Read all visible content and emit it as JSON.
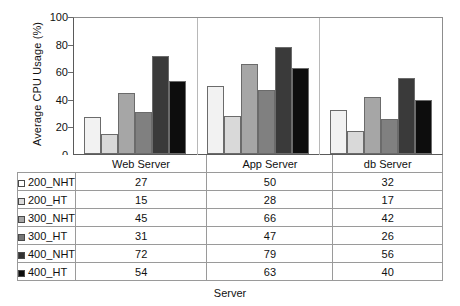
{
  "chart_data": {
    "type": "bar",
    "title": "",
    "xlabel": "Server",
    "ylabel": "Average CPU Usage (%)",
    "ylim": [
      0,
      100
    ],
    "yticks": [
      0,
      20,
      40,
      60,
      80,
      100
    ],
    "grid": false,
    "legend_position": "table-left-column",
    "categories": [
      "Web Server",
      "App Server",
      "db Server"
    ],
    "series": [
      {
        "name": "200_NHT",
        "color": "#f2f2f2",
        "values": [
          27,
          50,
          32
        ]
      },
      {
        "name": "200_HT",
        "color": "#d9d9d9",
        "values": [
          15,
          28,
          17
        ]
      },
      {
        "name": "300_NHT",
        "color": "#a6a6a6",
        "values": [
          45,
          66,
          42
        ]
      },
      {
        "name": "300_HT",
        "color": "#808080",
        "values": [
          31,
          47,
          26
        ]
      },
      {
        "name": "400_NHT",
        "color": "#3a3a3a",
        "values": [
          72,
          79,
          56
        ]
      },
      {
        "name": "400_HT",
        "color": "#0d0d0d",
        "values": [
          54,
          63,
          40
        ]
      }
    ]
  },
  "table": {
    "corner_label": "",
    "column_headers": [
      "Web Server",
      "App Server",
      "db Server"
    ],
    "rows": [
      {
        "label": "200_NHT",
        "color": "#ffffff",
        "values": [
          "27",
          "50",
          "32"
        ]
      },
      {
        "label": "200_HT",
        "color": "#dcdcdc",
        "values": [
          "15",
          "28",
          "17"
        ]
      },
      {
        "label": "300_NHT",
        "color": "#a6a6a6",
        "values": [
          "45",
          "66",
          "42"
        ]
      },
      {
        "label": "300_HT",
        "color": "#777777",
        "values": [
          "31",
          "47",
          "26"
        ]
      },
      {
        "label": "400_NHT",
        "color": "#333333",
        "values": [
          "72",
          "79",
          "56"
        ]
      },
      {
        "label": "400_HT",
        "color": "#0d0d0d",
        "values": [
          "54",
          "63",
          "40"
        ]
      }
    ]
  },
  "axes": {
    "y_title": "Average CPU Usage (%)",
    "x_title": "Server",
    "y_tick_labels": [
      "100",
      "80",
      "60",
      "40",
      "20",
      "0"
    ]
  }
}
